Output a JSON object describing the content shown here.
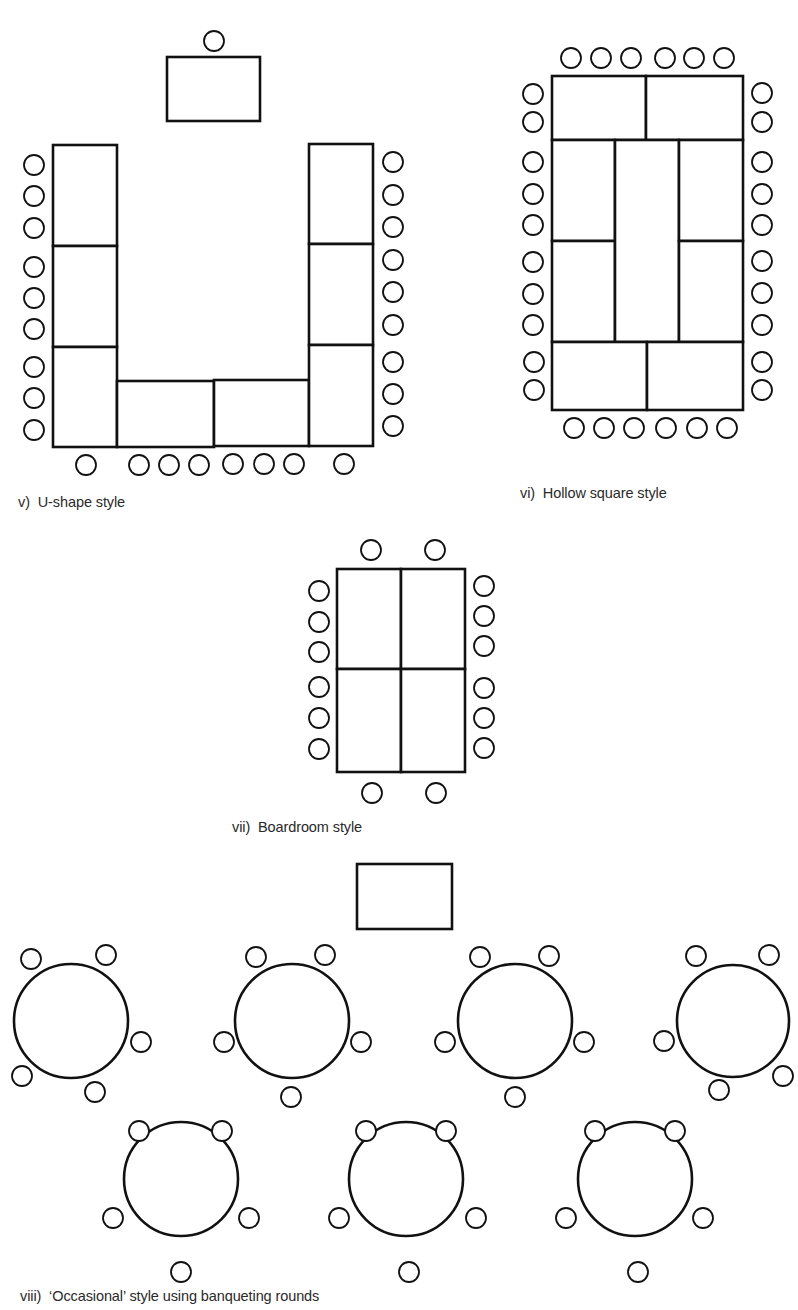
{
  "colors": {
    "stroke": "#111111",
    "background": "#ffffff",
    "caption": "#2a2a2a"
  },
  "layouts": [
    {
      "id": "u-shape",
      "caption": "v)  U-shape style",
      "caption_pos": [
        18,
        494
      ],
      "chair_r": 10,
      "tables": [
        {
          "name": "head-table",
          "x": 167,
          "y": 57,
          "w": 93,
          "h": 64
        },
        {
          "name": "left-arm-table-1",
          "x": 53,
          "y": 145,
          "w": 64,
          "h": 101
        },
        {
          "name": "left-arm-table-2",
          "x": 53,
          "y": 246,
          "w": 64,
          "h": 101
        },
        {
          "name": "left-arm-table-3",
          "x": 53,
          "y": 347,
          "w": 64,
          "h": 100
        },
        {
          "name": "base-table-1",
          "x": 117,
          "y": 381,
          "w": 97,
          "h": 66
        },
        {
          "name": "base-table-2",
          "x": 214,
          "y": 380,
          "w": 95,
          "h": 66
        },
        {
          "name": "right-arm-table-1",
          "x": 309,
          "y": 144,
          "w": 64,
          "h": 100
        },
        {
          "name": "right-arm-table-2",
          "x": 309,
          "y": 244,
          "w": 64,
          "h": 101
        },
        {
          "name": "right-arm-table-3",
          "x": 309,
          "y": 345,
          "w": 64,
          "h": 101
        }
      ],
      "chairs": [
        [
          214,
          41
        ],
        [
          34,
          165
        ],
        [
          34,
          196
        ],
        [
          34,
          228
        ],
        [
          34,
          267
        ],
        [
          34,
          298
        ],
        [
          34,
          329
        ],
        [
          34,
          367
        ],
        [
          34,
          398
        ],
        [
          34,
          430
        ],
        [
          393,
          162
        ],
        [
          393,
          195
        ],
        [
          393,
          227
        ],
        [
          393,
          260
        ],
        [
          393,
          292
        ],
        [
          393,
          325
        ],
        [
          393,
          362
        ],
        [
          393,
          394
        ],
        [
          393,
          426
        ],
        [
          86,
          465
        ],
        [
          139,
          465
        ],
        [
          169,
          465
        ],
        [
          199,
          465
        ],
        [
          233,
          464
        ],
        [
          264,
          464
        ],
        [
          294,
          464
        ],
        [
          344,
          464
        ]
      ]
    },
    {
      "id": "hollow-square",
      "caption": "vi)  Hollow square style",
      "caption_pos": [
        520,
        485
      ],
      "chair_r": 10,
      "tables": [
        {
          "name": "top-table-1",
          "x": 552,
          "y": 76,
          "w": 94,
          "h": 64
        },
        {
          "name": "top-table-2",
          "x": 646,
          "y": 76,
          "w": 97,
          "h": 64
        },
        {
          "name": "left-table-1",
          "x": 552,
          "y": 140,
          "w": 63,
          "h": 101
        },
        {
          "name": "left-table-2",
          "x": 552,
          "y": 241,
          "w": 63,
          "h": 101
        },
        {
          "name": "center-table",
          "x": 615,
          "y": 140,
          "w": 64,
          "h": 202
        },
        {
          "name": "right-table-1",
          "x": 679,
          "y": 140,
          "w": 64,
          "h": 101
        },
        {
          "name": "right-table-2",
          "x": 679,
          "y": 241,
          "w": 64,
          "h": 101
        },
        {
          "name": "bottom-table-1",
          "x": 552,
          "y": 342,
          "w": 95,
          "h": 68
        },
        {
          "name": "bottom-table-2",
          "x": 647,
          "y": 342,
          "w": 96,
          "h": 68
        }
      ],
      "chairs": [
        [
          571,
          58
        ],
        [
          601,
          58
        ],
        [
          631,
          58
        ],
        [
          665,
          58
        ],
        [
          694,
          58
        ],
        [
          724,
          58
        ],
        [
          533,
          94
        ],
        [
          533,
          122
        ],
        [
          533,
          162
        ],
        [
          533,
          194
        ],
        [
          533,
          225
        ],
        [
          533,
          262
        ],
        [
          533,
          294
        ],
        [
          533,
          325
        ],
        [
          534,
          362
        ],
        [
          534,
          390
        ],
        [
          762,
          93
        ],
        [
          762,
          122
        ],
        [
          762,
          162
        ],
        [
          762,
          194
        ],
        [
          762,
          225
        ],
        [
          762,
          261
        ],
        [
          762,
          293
        ],
        [
          762,
          325
        ],
        [
          762,
          362
        ],
        [
          762,
          390
        ],
        [
          574,
          428
        ],
        [
          604,
          428
        ],
        [
          634,
          428
        ],
        [
          666,
          428
        ],
        [
          697,
          428
        ],
        [
          727,
          428
        ]
      ]
    },
    {
      "id": "boardroom",
      "caption": "vii)  Boardroom style",
      "caption_pos": [
        232,
        819
      ],
      "chair_r": 10,
      "tables": [
        {
          "name": "board-table-1",
          "x": 337,
          "y": 569,
          "w": 64,
          "h": 100
        },
        {
          "name": "board-table-2",
          "x": 401,
          "y": 569,
          "w": 64,
          "h": 100
        },
        {
          "name": "board-table-3",
          "x": 337,
          "y": 669,
          "w": 64,
          "h": 103
        },
        {
          "name": "board-table-4",
          "x": 401,
          "y": 669,
          "w": 64,
          "h": 103
        }
      ],
      "chairs": [
        [
          371,
          550
        ],
        [
          435,
          550
        ],
        [
          319,
          591
        ],
        [
          319,
          622
        ],
        [
          319,
          652
        ],
        [
          319,
          687
        ],
        [
          319,
          718
        ],
        [
          319,
          749
        ],
        [
          484,
          586
        ],
        [
          484,
          616
        ],
        [
          484,
          646
        ],
        [
          484,
          688
        ],
        [
          484,
          718
        ],
        [
          484,
          748
        ],
        [
          372,
          793
        ],
        [
          436,
          793
        ]
      ]
    },
    {
      "id": "banqueting-rounds",
      "caption": "viii)  ‘Occasional’ style using banqueting rounds",
      "caption_pos": [
        20,
        1288
      ],
      "chair_r": 10,
      "tables": [
        {
          "name": "head-table",
          "x": 357,
          "y": 864,
          "w": 95,
          "h": 65
        }
      ],
      "rounds": [
        {
          "name": "round-table-1",
          "cx": 71,
          "cy": 1021,
          "r": 57,
          "chairs": [
            [
              31,
              959
            ],
            [
              106,
              955
            ],
            [
              141,
              1042
            ],
            [
              22,
              1076
            ],
            [
              95,
              1092
            ]
          ]
        },
        {
          "name": "round-table-2",
          "cx": 292,
          "cy": 1021,
          "r": 57,
          "chairs": [
            [
              256,
              957
            ],
            [
              325,
              955
            ],
            [
              224,
              1042
            ],
            [
              361,
              1042
            ],
            [
              291,
              1097
            ]
          ]
        },
        {
          "name": "round-table-3",
          "cx": 515,
          "cy": 1021,
          "r": 57,
          "chairs": [
            [
              480,
              957
            ],
            [
              549,
              956
            ],
            [
              445,
              1042
            ],
            [
              584,
              1042
            ],
            [
              515,
              1097
            ]
          ]
        },
        {
          "name": "round-table-4",
          "cx": 733,
          "cy": 1021,
          "r": 56,
          "chairs": [
            [
              696,
              956
            ],
            [
              769,
              955
            ],
            [
              664,
              1041
            ],
            [
              783,
              1076
            ],
            [
              719,
              1090
            ]
          ]
        },
        {
          "name": "round-table-5",
          "cx": 181,
          "cy": 1179,
          "r": 57,
          "chairs": [
            [
              139,
              1131
            ],
            [
              222,
              1131
            ],
            [
              113,
              1218
            ],
            [
              249,
              1218
            ],
            [
              181,
              1272
            ]
          ]
        },
        {
          "name": "round-table-6",
          "cx": 406,
          "cy": 1179,
          "r": 57,
          "chairs": [
            [
              366,
              1131
            ],
            [
              446,
              1131
            ],
            [
              339,
              1218
            ],
            [
              476,
              1218
            ],
            [
              409,
              1272
            ]
          ]
        },
        {
          "name": "round-table-7",
          "cx": 635,
          "cy": 1179,
          "r": 57,
          "chairs": [
            [
              595,
              1131
            ],
            [
              675,
              1131
            ],
            [
              566,
              1218
            ],
            [
              703,
              1218
            ],
            [
              638,
              1272
            ]
          ]
        }
      ]
    }
  ]
}
